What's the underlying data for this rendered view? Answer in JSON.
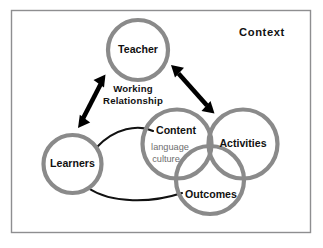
{
  "diagram": {
    "title_label": "Context",
    "background_color": "#ffffff",
    "frame_border_color": "#8e8e90",
    "circle_stroke_color": "#8a8a8a",
    "link_color": "#111111",
    "arrow_color": "#000000",
    "subtext_color": "#6e6e6e",
    "nodes": [
      {
        "id": "teacher",
        "label": "Teacher"
      },
      {
        "id": "learners",
        "label": "Learners"
      },
      {
        "id": "content",
        "label": "Content"
      },
      {
        "id": "activities",
        "label": "Activities"
      },
      {
        "id": "outcomes",
        "label": "Outcomes"
      }
    ],
    "content_subitems": [
      {
        "label": "language"
      },
      {
        "label": "culture"
      }
    ],
    "relationship": {
      "line1": "Working",
      "line2": "Relationship"
    }
  }
}
